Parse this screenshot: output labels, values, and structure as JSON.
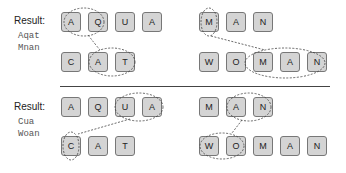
{
  "panels": [
    {
      "result_label": "Result:",
      "words": [
        "Aqat",
        "Mnan"
      ],
      "top_rows": [
        {
          "letters": [
            "A",
            "Q",
            "U",
            "A"
          ]
        },
        {
          "letters": [
            "M",
            "A",
            "N"
          ]
        }
      ],
      "bottom_rows": [
        {
          "letters": [
            "C",
            "A",
            "T"
          ]
        },
        {
          "letters": [
            "W",
            "O",
            "M",
            "A",
            "N"
          ]
        }
      ]
    },
    {
      "result_label": "Result:",
      "words": [
        "Cua",
        "Woan"
      ],
      "top_rows": [
        {
          "letters": [
            "A",
            "Q",
            "U",
            "A"
          ]
        },
        {
          "letters": [
            "M",
            "A",
            "N"
          ]
        }
      ],
      "bottom_rows": [
        {
          "letters": [
            "C",
            "A",
            "T"
          ]
        },
        {
          "letters": [
            "W",
            "O",
            "M",
            "A",
            "N"
          ]
        }
      ]
    }
  ],
  "colors": {
    "box_fill": "#d4d4d4",
    "box_border": "#777777",
    "dashed": "#444444"
  }
}
